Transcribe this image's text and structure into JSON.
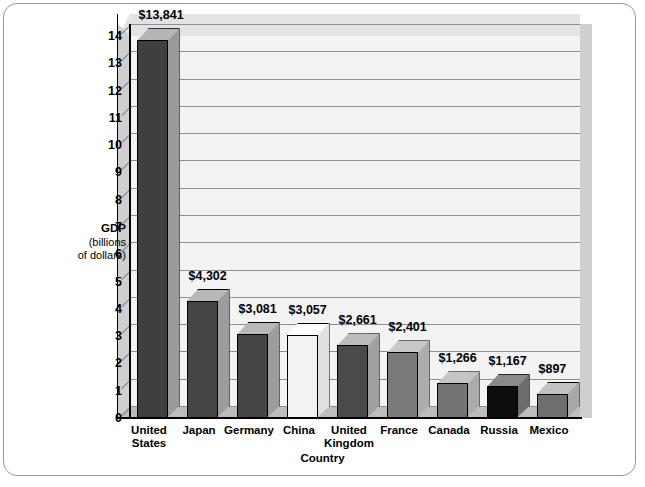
{
  "chart_data": {
    "type": "bar",
    "title": "",
    "xlabel": "Country",
    "ylabel": "GDP (billions of dollars)",
    "ylabel_main": "GDP",
    "ylabel_sub1": "(billions",
    "ylabel_sub2": "of dollars)",
    "ylim": [
      0,
      14
    ],
    "yticks": [
      "0",
      "1",
      "2",
      "3",
      "4",
      "5",
      "6",
      "7",
      "8",
      "9",
      "10",
      "11",
      "12",
      "13",
      "14"
    ],
    "y_unit_scale": "thousands of billions (trillions) — axis in units of 1,000",
    "grid": true,
    "legend": "none",
    "categories": [
      "United States",
      "Japan",
      "Germany",
      "China",
      "United Kingdom",
      "France",
      "Canada",
      "Russia",
      "Mexico"
    ],
    "category_lines": [
      [
        "United",
        "States"
      ],
      [
        "Japan"
      ],
      [
        "Germany"
      ],
      [
        "China"
      ],
      [
        "United",
        "Kingdom"
      ],
      [
        "France"
      ],
      [
        "Canada"
      ],
      [
        "Russia"
      ],
      [
        "Mexico"
      ]
    ],
    "values": [
      13841,
      4302,
      3081,
      3057,
      2661,
      2401,
      1266,
      1167,
      897
    ],
    "value_labels": [
      "$13,841",
      "$4,302",
      "$3,081",
      "$3,057",
      "$2,661",
      "$2,401",
      "$1,266",
      "$1,167",
      "$897"
    ],
    "bar_colors": [
      "#3f3f3f",
      "#454545",
      "#454545",
      "#f2f2f2",
      "#4a4a4a",
      "#7a7a7a",
      "#737373",
      "#0d0d0d",
      "#6f6f6f"
    ],
    "bar_top_colors": [
      "#b5b5b5",
      "#b8b8b8",
      "#b8b8b8",
      "#ffffff",
      "#bcbcbc",
      "#c8c8c8",
      "#c6c6c6",
      "#8a8a8a",
      "#c2c2c2"
    ],
    "bar_side_colors": [
      "#9a9a9a",
      "#9d9d9d",
      "#9d9d9d",
      "#e0e0e0",
      "#a0a0a0",
      "#adadad",
      "#ababab",
      "#6d6d6d",
      "#a8a8a8"
    ]
  },
  "colors": {
    "plot_background": "#f3f3f3",
    "wall_top": "#e3e3e3",
    "wall_side": "#cfcfcf",
    "floor": "#bdbdbd",
    "gridline": "#909090",
    "axis": "#000000",
    "frame_border": "#9a9a9a",
    "page_background": "#ffffff"
  }
}
